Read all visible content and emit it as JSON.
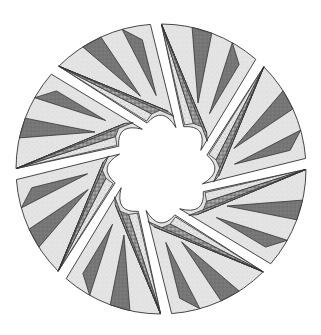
{
  "canvas": {
    "width": 321,
    "height": 335,
    "background": "#ffffff"
  },
  "block": {
    "center": [
      161,
      169
    ],
    "outer_radius": 145,
    "inner_radius": 42,
    "segment_count": 8,
    "gap_width": 11,
    "start_angle_deg": -92,
    "pinwheel_twist_deg": 28
  },
  "fabrics": {
    "light": "#e2e2e2",
    "dark": "#7a7a7a",
    "speckled": "#9a9a9a",
    "pale_speckle": "#d4d4d4",
    "outline": "#333333"
  },
  "segment_layout": {
    "description": "Each segment: light background wedge, one dark star point and one speckled double point fanning from the rim toward the center with a concave inner arc.",
    "pieces": [
      {
        "name": "background",
        "fabric": "light"
      },
      {
        "name": "dark-point",
        "fabric": "dark"
      },
      {
        "name": "speckled-point-a",
        "fabric": "speckled"
      },
      {
        "name": "speckled-point-b",
        "fabric": "speckled"
      },
      {
        "name": "inner-tip",
        "fabric": "pale_speckle"
      }
    ]
  }
}
